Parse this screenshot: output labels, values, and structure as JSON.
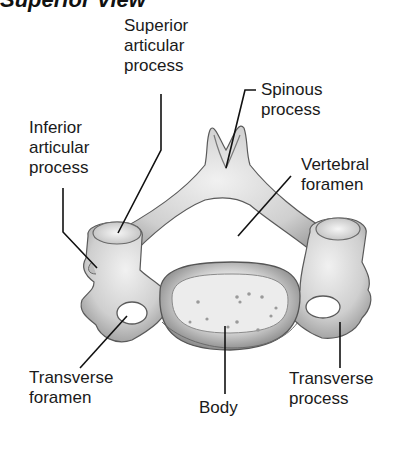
{
  "header": {
    "title": "Superior View"
  },
  "diagram": {
    "labels": [
      {
        "id": "superior-articular-process",
        "lines": [
          "Superior",
          "articular",
          "process"
        ]
      },
      {
        "id": "spinous-process",
        "lines": [
          "Spinous",
          "process"
        ]
      },
      {
        "id": "inferior-articular-process",
        "lines": [
          "Inferior",
          "articular",
          "process"
        ]
      },
      {
        "id": "vertebral-foramen",
        "lines": [
          "Vertebral",
          "foramen"
        ]
      },
      {
        "id": "transverse-foramen",
        "lines": [
          "Transverse",
          "foramen"
        ]
      },
      {
        "id": "body",
        "lines": [
          "Body"
        ]
      },
      {
        "id": "transverse-process",
        "lines": [
          "Transverse",
          "process"
        ]
      }
    ]
  },
  "colors": {
    "bone_fill": "#d9d9d9",
    "bone_shadow": "#8a8a8a",
    "outline": "#555555",
    "leader": "#111111",
    "text": "#1a1a1a"
  }
}
